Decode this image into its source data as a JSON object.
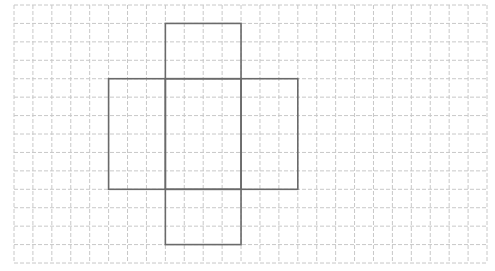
{
  "diagram": {
    "type": "grid-net",
    "grid": {
      "origin_x": 14,
      "origin_y": 5,
      "columns": 25,
      "rows": 14,
      "cell_width": 18.92,
      "cell_height": 18.43,
      "line_color": "#c8c8c8",
      "line_style": "dashed"
    },
    "net": {
      "line_color": "#6a6a6a",
      "faces": [
        {
          "name": "top-face",
          "col": 8,
          "row": 1,
          "width": 4,
          "height": 3
        },
        {
          "name": "left-face",
          "col": 5,
          "row": 4,
          "width": 3,
          "height": 6
        },
        {
          "name": "front-face",
          "col": 8,
          "row": 4,
          "width": 4,
          "height": 6
        },
        {
          "name": "right-face",
          "col": 12,
          "row": 4,
          "width": 3,
          "height": 6
        },
        {
          "name": "bottom-face",
          "col": 8,
          "row": 10,
          "width": 4,
          "height": 3
        }
      ]
    }
  }
}
